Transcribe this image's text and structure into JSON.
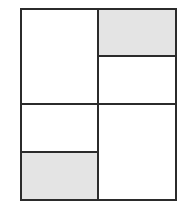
{
  "diagram": {
    "type": "grid-panels",
    "colors": {
      "stroke": "#2b2b2b",
      "shade": "#e4e4e4",
      "blank": "#ffffff"
    },
    "outer": {
      "x": 20,
      "y": 8,
      "width": 157,
      "height": 193
    },
    "panels": [
      {
        "id": "left-top",
        "x": 20,
        "y": 8,
        "width": 78,
        "height": 96,
        "shaded": false
      },
      {
        "id": "left-bottom-upper",
        "x": 20,
        "y": 104,
        "width": 78,
        "height": 48,
        "shaded": false
      },
      {
        "id": "left-bottom-lower",
        "x": 20,
        "y": 152,
        "width": 78,
        "height": 49,
        "shaded": true
      },
      {
        "id": "right-top-upper",
        "x": 98,
        "y": 8,
        "width": 79,
        "height": 48,
        "shaded": true
      },
      {
        "id": "right-top-lower",
        "x": 98,
        "y": 56,
        "width": 79,
        "height": 48,
        "shaded": false
      },
      {
        "id": "right-bottom",
        "x": 98,
        "y": 104,
        "width": 79,
        "height": 97,
        "shaded": false
      }
    ]
  }
}
